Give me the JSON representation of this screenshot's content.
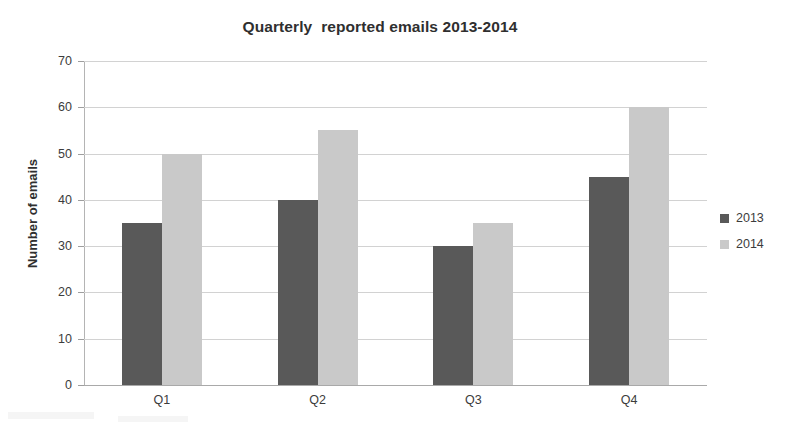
{
  "chart_data": {
    "type": "bar",
    "title": "Quarterly  reported emails 2013-2014",
    "xlabel": "",
    "ylabel": "Number of emails",
    "categories": [
      "Q1",
      "Q2",
      "Q3",
      "Q4"
    ],
    "series": [
      {
        "name": "2013",
        "color": "#595959",
        "values": [
          35,
          40,
          30,
          45
        ]
      },
      {
        "name": "2014",
        "color": "#c9c9c9",
        "values": [
          50,
          55,
          35,
          60
        ]
      }
    ],
    "ylim": [
      0,
      70
    ],
    "ytick_step": 10,
    "yticks": [
      70,
      60,
      50,
      40,
      30,
      20,
      10,
      0
    ],
    "ytick_labels": [
      "70",
      "60",
      "50",
      "40",
      "30",
      "20",
      "10",
      "0"
    ],
    "grid": "horizontal",
    "legend_position": "right",
    "legend_entries": [
      "2013",
      "2014"
    ],
    "background_color": "#ffffff",
    "gridline_color": "#d2d2d2",
    "axis_color": "#b4b4b4",
    "text_color": "#3c3c3c"
  }
}
